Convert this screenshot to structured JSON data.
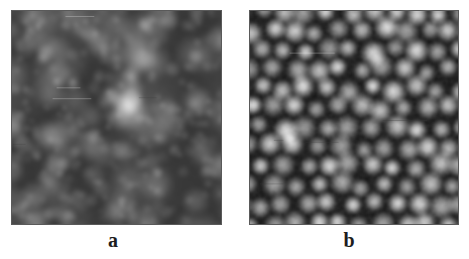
{
  "figure": {
    "background_color": "#ffffff",
    "width": 469,
    "height": 259,
    "border_color": "#5a5a5a",
    "label_color": "#1d1d1d",
    "panels": [
      {
        "id": "a",
        "label": "a",
        "image_type": "grayscale-micrograph",
        "description": "AFM topography image showing large coalesced granular clusters with blurred boundaries",
        "x": 11,
        "y": 10,
        "width": 211,
        "height": 215,
        "grain_style": "large-coarse-clusters",
        "grain_radius_px": 17,
        "grain_count": 150,
        "cluster_radius_px": 42,
        "cluster_count": 16,
        "blur_px": 2.2,
        "base_gray": 135,
        "contrast": 0.85,
        "seed": 20251,
        "label_x": 113,
        "label_y": 240
      },
      {
        "id": "b",
        "label": "b",
        "image_type": "grayscale-micrograph",
        "description": "AFM topography image showing uniform close-packed small grains with dark inter-grain boundaries",
        "x": 249,
        "y": 10,
        "width": 210,
        "height": 215,
        "grain_style": "uniform-close-packed",
        "grain_radius_px": 13,
        "grain_count": 260,
        "cluster_radius_px": 0,
        "cluster_count": 0,
        "blur_px": 1.2,
        "base_gray": 125,
        "contrast": 1.05,
        "seed": 77413,
        "label_x": 349,
        "label_y": 240
      }
    ]
  }
}
